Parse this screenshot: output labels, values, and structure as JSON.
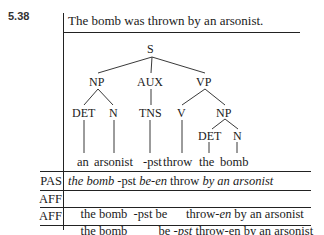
{
  "example_number": "5.38",
  "sentence": "The bomb was thrown by an arsonist.",
  "tree": {
    "root": "S",
    "level1": [
      "NP",
      "AUX",
      "VP"
    ],
    "level2": [
      "DET",
      "N",
      "TNS",
      "V",
      "NP"
    ],
    "level3": [
      "DET",
      "N"
    ],
    "leaves": [
      "an",
      "arsonist",
      "-pst",
      "throw",
      "the",
      "bomb"
    ]
  },
  "derivation_rows": [
    {
      "tag": "PAS",
      "segments": [
        {
          "text": "the bomb",
          "italic": true
        },
        {
          "text": " -pst ",
          "italic": false
        },
        {
          "text": "be-en",
          "italic": true
        },
        {
          "text": " throw ",
          "italic": false
        },
        {
          "text": "by an arsonist",
          "italic": true
        }
      ]
    },
    {
      "tag": "AFF",
      "segments": [
        {
          "text": "the bomb  -pst be      throw-",
          "italic": false
        },
        {
          "text": "en",
          "italic": true
        },
        {
          "text": " by an arsonist",
          "italic": false
        }
      ]
    },
    {
      "tag": "AFF",
      "segments": [
        {
          "text": "the bomb          be -",
          "italic": false
        },
        {
          "text": "pst",
          "italic": true
        },
        {
          "text": " throw-en by an arsonist",
          "italic": false
        }
      ]
    }
  ]
}
